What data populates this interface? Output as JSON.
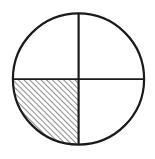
{
  "figure": {
    "title": "Circle divided into four quadrants with lower-left quadrant shaded",
    "background_color": "#ffffff",
    "stroke_color": "#1a1a1a",
    "hatch_color": "#2b2b2b",
    "canvas": {
      "width": 155,
      "height": 159
    },
    "circle": {
      "name": "outer-circle",
      "center_x": 78.5,
      "center_y": 79,
      "radius": 66,
      "stroke_width": 2.2,
      "fill": "none"
    },
    "diameters": [
      {
        "name": "vertical-diameter",
        "orientation": "vertical",
        "x1": 78.5,
        "y1": 13,
        "x2": 78.5,
        "y2": 145,
        "stroke_width": 2.2
      },
      {
        "name": "horizontal-diameter",
        "orientation": "horizontal",
        "x1": 12.5,
        "y1": 79,
        "x2": 144.5,
        "y2": 79,
        "stroke_width": 1.8
      }
    ],
    "quadrants": [
      {
        "name": "upper-left-quadrant",
        "position": "upper-left",
        "shaded": false,
        "fraction": "1/4"
      },
      {
        "name": "upper-right-quadrant",
        "position": "upper-right",
        "shaded": false,
        "fraction": "1/4"
      },
      {
        "name": "lower-left-quadrant",
        "position": "lower-left",
        "shaded": true,
        "fraction": "1/4",
        "fill_pattern": "diagonal-hatch"
      },
      {
        "name": "lower-right-quadrant",
        "position": "lower-right",
        "shaded": false,
        "fraction": "1/4"
      }
    ],
    "hatch": {
      "name": "diagonal-hatch-pattern",
      "direction": "lower-left-to-upper-right",
      "angle_degrees": 45,
      "spacing": 4,
      "line_width": 1.1
    }
  }
}
